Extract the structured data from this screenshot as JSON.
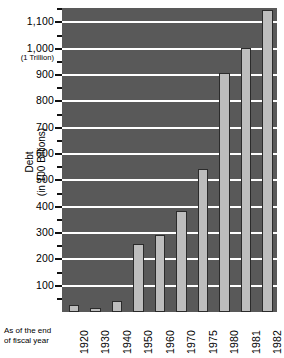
{
  "chart_data": {
    "type": "bar",
    "title": "",
    "xlabel": "As of the end of fiscal year",
    "ylabel": "Debt (in 100 Billions)",
    "ylabel_line1": "Debt",
    "ylabel_line2": "(in 100 Billions)",
    "categories": [
      "1920",
      "1930",
      "1940",
      "1950",
      "1960",
      "1970",
      "1975",
      "1980",
      "1981",
      "1982"
    ],
    "values": [
      25,
      16,
      43,
      257,
      291,
      382,
      544,
      908,
      1004,
      1147
    ],
    "ytick_labels": [
      "1,100",
      "1,000",
      "900",
      "800",
      "700",
      "600",
      "500",
      "400",
      "300",
      "200",
      "100"
    ],
    "ytick_values": [
      1100,
      1000,
      900,
      800,
      700,
      600,
      500,
      400,
      300,
      200,
      100
    ],
    "ytick_minor_values": [
      1150,
      1050,
      950,
      850,
      750,
      650,
      550,
      450,
      350,
      250,
      150,
      50
    ],
    "annotation_1000": "(1 Trillion)",
    "ylim": [
      0,
      1180
    ],
    "grid": true,
    "legend": "none",
    "colors": {
      "plot_background": "#595959",
      "bar_fill": "#bdbdbd",
      "bar_stroke": "#2b2b2b",
      "gridline": "#ffffff",
      "text": "#000000",
      "page_background": "#ffffff"
    }
  },
  "footnote": {
    "line1": "As of the end",
    "line2": "of fiscal year"
  }
}
